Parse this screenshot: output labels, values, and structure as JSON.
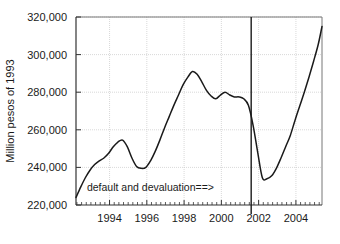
{
  "chart_data": {
    "type": "line",
    "title": "",
    "subtitle": "",
    "xlabel": "",
    "ylabel": "Million pesos of 1993",
    "xlim": [
      1992.2,
      2005.4
    ],
    "ylim": [
      220000,
      320000
    ],
    "grid": true,
    "legend": null,
    "x_ticks": [
      1994,
      1996,
      1998,
      2000,
      2002,
      2004
    ],
    "x_tick_labels": [
      "1994",
      "1996",
      "1998",
      "2000",
      "2002",
      "2004"
    ],
    "x_minor_tick_step": 0.25,
    "y_ticks": [
      220000,
      240000,
      260000,
      280000,
      300000,
      320000
    ],
    "y_tick_labels": [
      "220,000",
      "240,000",
      "260,000",
      "280,000",
      "300,000",
      "320,000"
    ],
    "line_color": "#1a1a1a",
    "grid_color": "#c8c8c8",
    "axis_color": "#555555",
    "annotations": [
      {
        "name": "default-and-devaluation",
        "text": "default and devaluation==>",
        "x": 1999.6,
        "y": 227500,
        "anchor": "start"
      }
    ],
    "vertical_markers": [
      {
        "name": "default-event-line",
        "x": 2001.6,
        "color": "#1a1a1a"
      }
    ],
    "series": [
      {
        "name": "Real GDP",
        "x": [
          1992.2,
          1992.45,
          1992.7,
          1992.95,
          1993.2,
          1993.45,
          1993.7,
          1993.95,
          1994.2,
          1994.45,
          1994.7,
          1994.95,
          1995.2,
          1995.45,
          1995.7,
          1995.95,
          1996.2,
          1996.45,
          1996.7,
          1996.95,
          1997.2,
          1997.45,
          1997.7,
          1997.95,
          1998.2,
          1998.45,
          1998.7,
          1998.95,
          1999.2,
          1999.45,
          1999.7,
          1999.95,
          2000.2,
          2000.45,
          2000.7,
          2000.95,
          2001.2,
          2001.45,
          2001.7,
          2001.95,
          2002.2,
          2002.45,
          2002.7,
          2002.95,
          2003.2,
          2003.45,
          2003.7,
          2003.95,
          2004.2,
          2004.45,
          2004.7,
          2004.95,
          2005.2,
          2005.4
        ],
        "y": [
          224000,
          229500,
          234500,
          238500,
          241500,
          243500,
          245000,
          247500,
          251000,
          253500,
          254500,
          251000,
          245000,
          240500,
          239500,
          240000,
          243500,
          248500,
          254500,
          261000,
          267000,
          273000,
          278500,
          284000,
          288000,
          291000,
          289500,
          285500,
          281000,
          278000,
          276500,
          278500,
          280000,
          278500,
          277500,
          277500,
          276500,
          273000,
          262500,
          248000,
          234500,
          234000,
          235500,
          239500,
          245000,
          251000,
          257000,
          265000,
          272500,
          280000,
          288000,
          296500,
          305500,
          315000
        ]
      }
    ]
  },
  "axis": {
    "y_label": "Million pesos of 1993"
  }
}
